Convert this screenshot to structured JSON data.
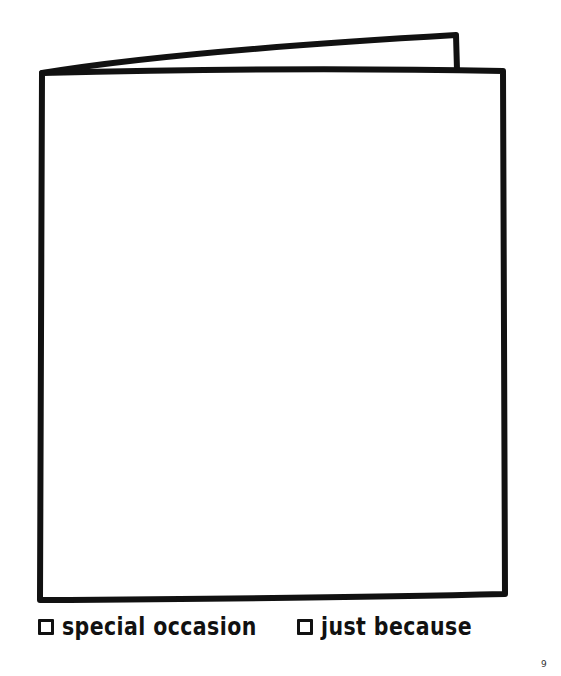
{
  "page": {
    "type": "greeting card template worksheet",
    "page_number": "9"
  },
  "card": {
    "description": "blank folded greeting card outline",
    "stroke_color": "#111111",
    "background_color": "#ffffff"
  },
  "options": [
    {
      "label": "special occasion",
      "checked": false
    },
    {
      "label": "just because",
      "checked": false
    }
  ]
}
